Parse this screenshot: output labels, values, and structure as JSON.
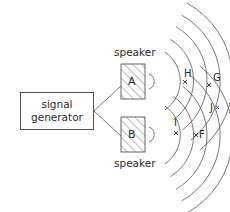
{
  "diagram": {
    "generator": {
      "line1": "signal",
      "line2": "generator"
    },
    "speakers": [
      {
        "id": "A",
        "label": "A",
        "caption": "speaker"
      },
      {
        "id": "B",
        "label": "B",
        "caption": "speaker"
      }
    ],
    "points": [
      {
        "id": "H",
        "label": "H"
      },
      {
        "id": "G",
        "label": "G"
      },
      {
        "id": "J",
        "label": "J"
      },
      {
        "id": "I",
        "label": "I"
      },
      {
        "id": "F",
        "label": "F"
      }
    ],
    "colors": {
      "line": "#555555",
      "text": "#2a2a2a",
      "background": "#ffffff"
    }
  }
}
